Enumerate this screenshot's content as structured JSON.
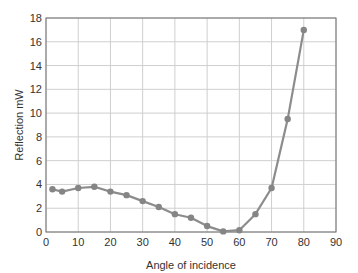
{
  "chart_data": {
    "type": "line",
    "title": "",
    "xlabel": "Angle of incidence",
    "ylabel": "Reflection mW",
    "xlim": [
      0,
      90
    ],
    "ylim": [
      0,
      18
    ],
    "xticks": [
      0,
      10,
      20,
      30,
      40,
      50,
      60,
      70,
      80,
      90
    ],
    "yticks": [
      0,
      2,
      4,
      6,
      8,
      10,
      12,
      14,
      16,
      18
    ],
    "grid": true,
    "legend": null,
    "series": [
      {
        "name": "Reflection",
        "x": [
          2,
          5,
          10,
          15,
          20,
          25,
          30,
          35,
          40,
          45,
          50,
          55,
          60,
          65,
          70,
          75,
          80
        ],
        "values": [
          3.6,
          3.4,
          3.7,
          3.8,
          3.4,
          3.1,
          2.6,
          2.1,
          1.5,
          1.2,
          0.5,
          0.05,
          0.15,
          1.5,
          3.7,
          9.5,
          17.0
        ]
      }
    ]
  },
  "colors": {
    "line": "#8c8c8c",
    "marker": "#858585",
    "grid": "#cfcfcf",
    "frame": "#6e6e6e",
    "text": "#333333"
  }
}
